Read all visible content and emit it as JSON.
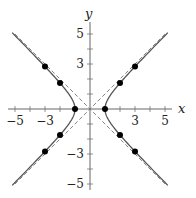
{
  "chart_data": {
    "type": "line",
    "title": "",
    "xlabel": "x",
    "ylabel": "y",
    "xlim": [
      -5.3,
      5.3
    ],
    "ylim": [
      -5.3,
      5.3
    ],
    "grid": false,
    "x_ticks": [
      -5,
      -4,
      -3,
      -2,
      -1,
      1,
      2,
      3,
      4,
      5
    ],
    "y_ticks": [
      -5,
      -4,
      -3,
      -2,
      -1,
      1,
      2,
      3,
      4,
      5
    ],
    "x_tick_labels": [
      "-5",
      "-3",
      "3",
      "5"
    ],
    "y_tick_labels": [
      "5",
      "3",
      "-3",
      "-5"
    ],
    "series": [
      {
        "name": "hyperbola x^2 - y^2 = 1",
        "style": "solid",
        "color": "#555555"
      },
      {
        "name": "asymptote y = x",
        "style": "dashed",
        "color": "#777777"
      },
      {
        "name": "asymptote y = -x",
        "style": "dashed",
        "color": "#777777"
      }
    ],
    "points": [
      {
        "x": 1,
        "y": 0
      },
      {
        "x": -1,
        "y": 0
      },
      {
        "x": 2,
        "y": 1.73
      },
      {
        "x": 2,
        "y": -1.73
      },
      {
        "x": -2,
        "y": 1.73
      },
      {
        "x": -2,
        "y": -1.73
      },
      {
        "x": 3,
        "y": 2.83
      },
      {
        "x": 3,
        "y": -2.83
      },
      {
        "x": -3,
        "y": 2.83
      },
      {
        "x": -3,
        "y": -2.83
      }
    ]
  },
  "axes": {
    "x_label": "x",
    "y_label": "y"
  }
}
